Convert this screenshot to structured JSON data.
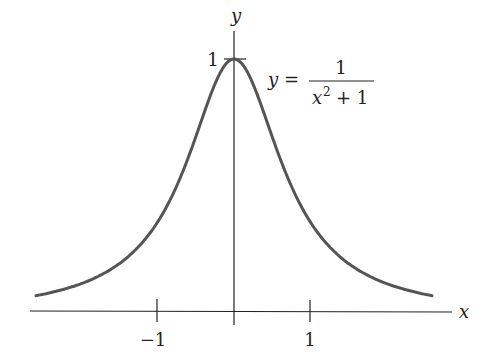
{
  "chart_data": {
    "type": "line",
    "title": "",
    "xlabel": "x",
    "ylabel": "y",
    "function": "y = 1/(x^2 + 1)",
    "annotation": {
      "lhs": "y =",
      "numerator": "1",
      "denominator_base": "x",
      "denominator_exp": "2",
      "denominator_rest": "+ 1"
    },
    "x_ticks": [
      {
        "value": -1,
        "label": "−1"
      },
      {
        "value": 1,
        "label": "1"
      }
    ],
    "y_ticks": [
      {
        "value": 1,
        "label": "1"
      }
    ],
    "x_range": [
      -2.6,
      2.6
    ],
    "y_range": [
      0,
      1
    ],
    "grid": false,
    "legend": "none",
    "series": [
      {
        "name": "1/(x^2+1)",
        "x": [
          -2.5,
          -2,
          -1.5,
          -1,
          -0.5,
          0,
          0.5,
          1,
          1.5,
          2,
          2.5
        ],
        "values": [
          0.138,
          0.2,
          0.308,
          0.5,
          0.8,
          1.0,
          0.8,
          0.5,
          0.308,
          0.2,
          0.138
        ]
      }
    ],
    "colors": {
      "curve": "#555555",
      "axes": "#222222"
    }
  }
}
